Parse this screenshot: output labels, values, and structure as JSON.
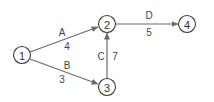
{
  "diagram": {
    "type": "directed-network",
    "colors": {
      "stroke": "#3a3a3a",
      "edge": "#6b6b6b",
      "text": "#333333"
    },
    "nodes": [
      {
        "id": "1",
        "label": "1",
        "x": 22,
        "y": 55
      },
      {
        "id": "2",
        "label": "2",
        "x": 107,
        "y": 24
      },
      {
        "id": "3",
        "label": "3",
        "x": 107,
        "y": 87
      },
      {
        "id": "4",
        "label": "4",
        "x": 187,
        "y": 24
      }
    ],
    "edges": [
      {
        "name": "A",
        "from": "1",
        "to": "2",
        "weight": "4"
      },
      {
        "name": "B",
        "from": "1",
        "to": "3",
        "weight": "3"
      },
      {
        "name": "C",
        "from": "3",
        "to": "2",
        "weight": "7"
      },
      {
        "name": "D",
        "from": "2",
        "to": "4",
        "weight": "5"
      }
    ]
  }
}
